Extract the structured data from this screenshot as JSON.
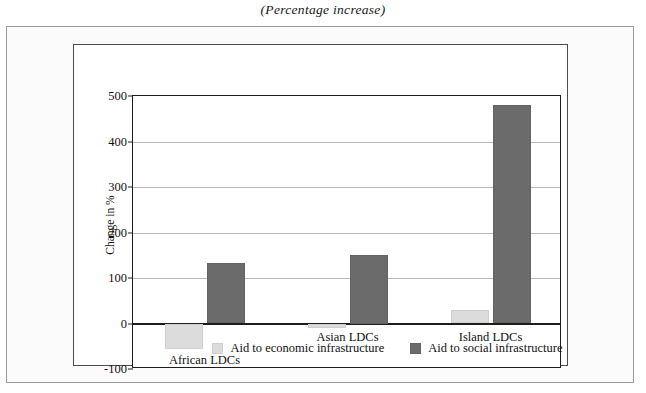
{
  "title": "(Percentage increase)",
  "chart_data": {
    "type": "bar",
    "title": "(Percentage increase)",
    "xlabel": "",
    "ylabel": "Change in %",
    "ylim": [
      -100,
      500
    ],
    "yticks": [
      -100,
      0,
      100,
      200,
      300,
      400,
      500
    ],
    "ytick_labels": [
      "-100",
      "0",
      "100",
      "200",
      "300",
      "400",
      "500"
    ],
    "grid": true,
    "legend_position": "bottom",
    "categories": [
      "African LDCs",
      "Asian LDCs",
      "Island LDCs"
    ],
    "series": [
      {
        "name": "Aid to economic infrastructure",
        "color": "#dcdcdc",
        "values": [
          -57,
          -10,
          30
        ]
      },
      {
        "name": "Aid to social infrastructure",
        "color": "#6b6b6b",
        "values": [
          133,
          150,
          480
        ]
      }
    ]
  },
  "legend": {
    "items": [
      {
        "label": "Aid to economic infrastructure",
        "swatch": "economic"
      },
      {
        "label": "Aid to social infrastructure",
        "swatch": "social"
      }
    ]
  }
}
